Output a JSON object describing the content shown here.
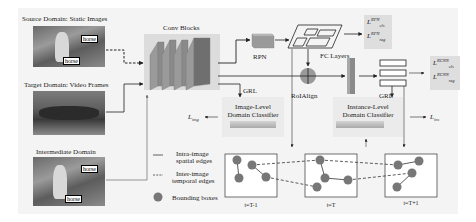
{
  "domains": {
    "source": {
      "title": "Source Domain: Static Images",
      "tags": [
        "horse",
        "horse"
      ]
    },
    "target": {
      "title": "Target Domain: Video Frames"
    },
    "intermediate": {
      "title": "Intermediate Domain",
      "tags": [
        "horse",
        "horse"
      ]
    }
  },
  "modules": {
    "conv_blocks": "Conv Blocks",
    "rpn": "RPN",
    "fc_layers": "FC Layers",
    "roi_align": "RoIAlign",
    "grl_image": "GRL",
    "grl_instance": "GRL",
    "image_classifier": [
      "Image-Level",
      "Domain Classifier"
    ],
    "instance_classifier": [
      "Instance-Level",
      "Domain Classifier"
    ]
  },
  "losses": {
    "rpn_cls": {
      "base": "L",
      "sup": "RPN",
      "sub": "cls"
    },
    "rpn_reg": {
      "base": "L",
      "sup": "RPN",
      "sub": "reg"
    },
    "rcnn_cls": {
      "base": "L",
      "sup": "RCNN",
      "sub": "cls"
    },
    "rcnn_reg": {
      "base": "L",
      "sup": "RCNN",
      "sub": "reg"
    },
    "img": {
      "base": "L",
      "sub": "img"
    },
    "ins": {
      "base": "L",
      "sub": "ins"
    }
  },
  "legend": {
    "intra": [
      "Intra-image",
      "spatial edges"
    ],
    "inter": [
      "Inter-image",
      "temporal edges"
    ],
    "boxes": "Bounding boxes"
  },
  "frames": [
    "t=T-1",
    "t=T",
    "t=T+1"
  ],
  "colors": {
    "background": "#f4f4f4",
    "node": "#777777",
    "line": "#222222",
    "conv_block": "#8a8a8a",
    "loss_box": "#dedede"
  }
}
